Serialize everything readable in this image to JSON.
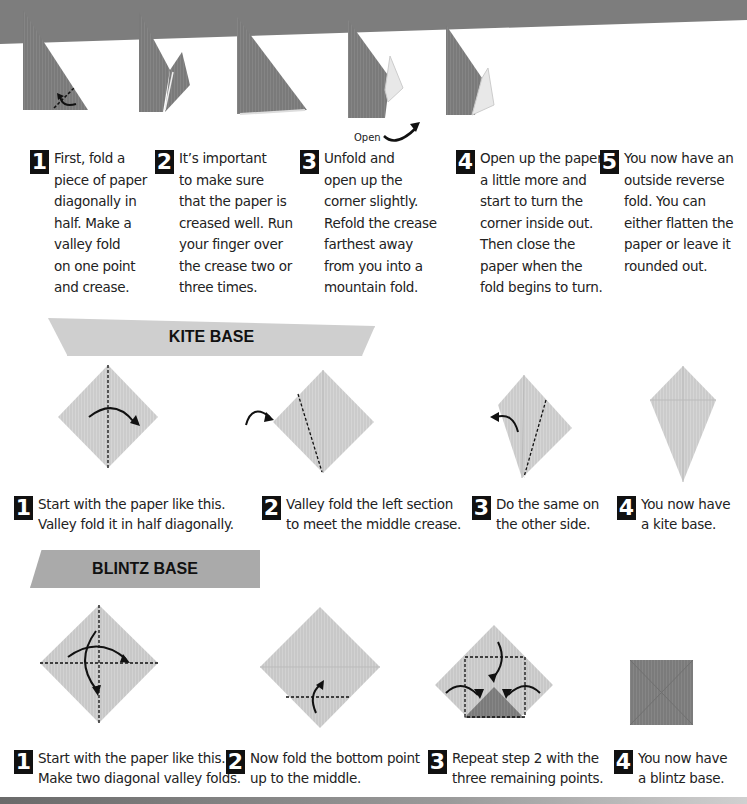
{
  "top_section": {
    "open_label": "Open",
    "steps": [
      {
        "num": "1",
        "text": "First, fold a\npiece of paper\ndiagonally in\nhalf. Make a\nvalley fold\non one point\nand crease."
      },
      {
        "num": "2",
        "text": "It’s important\nto make sure\nthat the paper is\ncreased well. Run\nyour finger over\nthe crease two or\nthree times."
      },
      {
        "num": "3",
        "text": "Unfold and\nopen up the\ncorner slightly.\nRefold the crease\nfarthest away\nfrom you into a\nmountain fold."
      },
      {
        "num": "4",
        "text": "Open up the paper\na little more and\nstart to turn the\ncorner inside out.\nThen close the\npaper when the\nfold begins to turn."
      },
      {
        "num": "5",
        "text": "You now have an\noutside reverse\nfold. You can\neither flatten the\npaper or leave it\nrounded out."
      }
    ]
  },
  "kite_base": {
    "title": "KITE BASE",
    "steps": [
      {
        "num": "1",
        "text": "Start with the paper like this.\nValley fold it in half diagonally."
      },
      {
        "num": "2",
        "text": "Valley fold the left section\nto meet the middle crease."
      },
      {
        "num": "3",
        "text": "Do the same on\nthe other side."
      },
      {
        "num": "4",
        "text": "You now have\na kite base."
      }
    ]
  },
  "blintz_base": {
    "title": "BLINTZ BASE",
    "steps": [
      {
        "num": "1",
        "text": "Start with the paper like this.\nMake two diagonal valley folds."
      },
      {
        "num": "2",
        "text": "Now fold the bottom point\nup to the middle."
      },
      {
        "num": "3",
        "text": "Repeat step 2 with the\nthree remaining points."
      },
      {
        "num": "4",
        "text": "You now have\na blintz base."
      }
    ]
  },
  "colors": {
    "dark_paper": "#7d7d7d",
    "light_paper": "#cfcfcf",
    "banner_kite": "#cfcfcf",
    "banner_blintz": "#aaaaaa",
    "number_badge": "#111111"
  }
}
